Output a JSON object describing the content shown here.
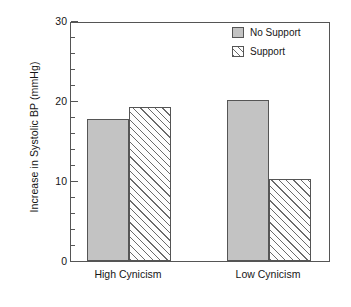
{
  "chart_data": {
    "type": "bar",
    "title": "",
    "subtitle": "",
    "xlabel": "",
    "ylabel": "Increase in Systolic BP (mmHg)",
    "categories": [
      "High Cynicism",
      "Low Cynicism"
    ],
    "series": [
      {
        "name": "No Support",
        "values": [
          17.7,
          20.1
        ],
        "fill": "solid",
        "color": "#c3c3c3"
      },
      {
        "name": "Support",
        "values": [
          19.2,
          10.2
        ],
        "fill": "hatch",
        "color": "#ffffff"
      }
    ],
    "ylim": [
      0,
      30
    ],
    "ytick_major": [
      0,
      10,
      20,
      30
    ],
    "ytick_minor_step": 2,
    "ytick_labels": [
      "0",
      "10",
      "20",
      "30"
    ],
    "grid": false,
    "legend_position": "top-right",
    "annotations": []
  },
  "legend": {
    "entries": [
      {
        "label": "No Support",
        "style": "solid"
      },
      {
        "label": "Support",
        "style": "hatch"
      }
    ]
  },
  "axis": {
    "y_title": "Increase in Systolic BP (mmHg)",
    "x_categories": [
      "High Cynicism",
      "Low Cynicism"
    ]
  },
  "colors": {
    "bar_fill": "#c3c3c3",
    "bar_edge": "#555555",
    "hatch_line": "#6a6a6a",
    "axis": "#555555",
    "text": "#161616",
    "background": "#ffffff"
  }
}
